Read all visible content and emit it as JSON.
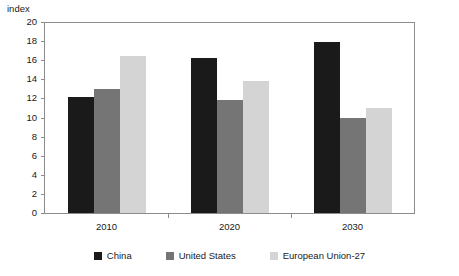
{
  "chart_data": {
    "type": "bar",
    "title": "",
    "subtitle": "",
    "xlabel": "",
    "ylabel": "index",
    "categories": [
      "2010",
      "2020",
      "2030"
    ],
    "series": [
      {
        "name": "China",
        "color": "#1a1a1a",
        "values": [
          12.2,
          16.3,
          18.0
        ]
      },
      {
        "name": "United States",
        "color": "#757575",
        "values": [
          13.1,
          11.9,
          10.0
        ]
      },
      {
        "name": "European Union-27",
        "color": "#d4d4d4",
        "values": [
          16.5,
          13.9,
          11.1
        ]
      }
    ],
    "ylim": [
      0,
      20
    ],
    "ytick_step": 2,
    "yticks": [
      20,
      18,
      16,
      14,
      12,
      10,
      8,
      6,
      4,
      2,
      0
    ],
    "grid": false,
    "legend_position": "bottom",
    "frame": true,
    "bar_gap_within_group": 0
  }
}
